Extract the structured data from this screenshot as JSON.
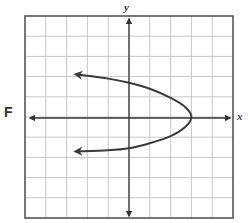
{
  "panel": {
    "label": "F"
  },
  "chart_data": {
    "type": "line",
    "title": "",
    "xlabel": "x",
    "ylabel": "y",
    "xlim": [
      -5,
      5
    ],
    "ylim": [
      -5,
      5
    ],
    "grid": true,
    "grid_step": 1,
    "equation_estimate": "x = 3 - y^2 (approximate)",
    "vertex": [
      3,
      0
    ],
    "series": [
      {
        "name": "curve",
        "points": [
          [
            -2.5,
            2.1
          ],
          [
            -1,
            1.9
          ],
          [
            0,
            1.7
          ],
          [
            1,
            1.4
          ],
          [
            2,
            0.95
          ],
          [
            2.7,
            0.5
          ],
          [
            3,
            0
          ],
          [
            2.7,
            -0.5
          ],
          [
            2,
            -0.95
          ],
          [
            1,
            -1.3
          ],
          [
            0,
            -1.55
          ],
          [
            -1,
            -1.65
          ],
          [
            -2.5,
            -1.7
          ]
        ],
        "arrow_ends": true
      }
    ],
    "axis_arrows": true
  },
  "colors": {
    "grid": "#c8c8c8",
    "axis": "#333333",
    "curve": "#3a3a3a",
    "border": "#555555"
  }
}
